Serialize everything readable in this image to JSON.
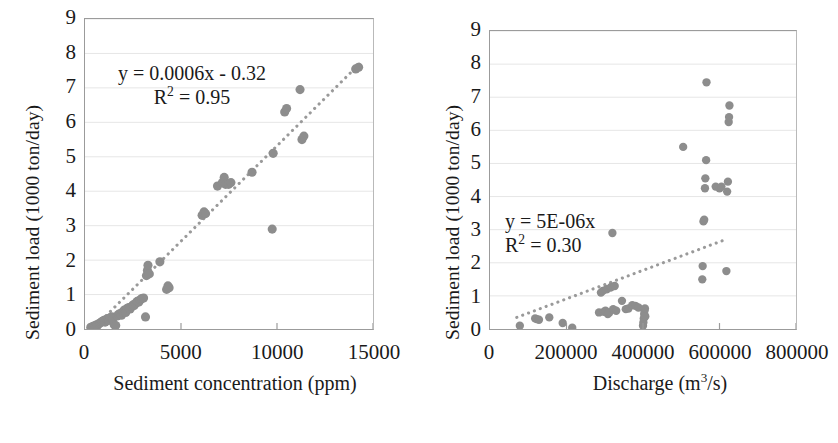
{
  "figure": {
    "marker_color": "#8d8d8d",
    "trendline_color": "#9a9a9a",
    "gridline_color": "#e6e6e6",
    "axis_color": "#9b9b9b",
    "text_color": "#1a1a1a"
  },
  "panels": [
    {
      "id": "left",
      "ytitle": "Sediment load (1000 ton/day)",
      "xtitle_plain": "Sediment concentration (ppm)",
      "equation_line1": "y = 0.0006x - 0.32",
      "equation_line2_prefix": "R",
      "equation_line2_sup": "2",
      "equation_line2_suffix": " = 0.95"
    },
    {
      "id": "right",
      "ytitle": "Sediment load (1000 ton/day)",
      "xtitle_prefix": "Discharge (m",
      "xtitle_sup": "3",
      "xtitle_suffix": "/s)",
      "equation_line1": "y = 5E-06x",
      "equation_line2_prefix": "R",
      "equation_line2_sup": "2",
      "equation_line2_suffix": " = 0.30"
    }
  ],
  "chart_data": [
    {
      "type": "scatter",
      "panel": "left",
      "title": "",
      "xlabel": "Sediment concentration (ppm)",
      "ylabel": "Sediment load (1000 ton/day)",
      "xlim": [
        0,
        15000
      ],
      "ylim": [
        0,
        9
      ],
      "xticks": [
        0,
        5000,
        10000,
        15000
      ],
      "xtick_labels": [
        "0",
        "5000",
        "10000",
        "15000"
      ],
      "yticks": [
        0,
        1,
        2,
        3,
        4,
        5,
        6,
        7,
        8,
        9
      ],
      "ytick_labels": [
        "0",
        "1",
        "2",
        "3",
        "4",
        "5",
        "6",
        "7",
        "8",
        "9"
      ],
      "grid": "horizontal",
      "legend": "none",
      "marker": "circle",
      "marker_color": "#8d8d8d",
      "annotation": {
        "text": "y = 0.0006x - 0.32 ; R² = 0.95",
        "equation": "y = 0.0006x - 0.32",
        "r_squared": 0.95,
        "slope": 0.0006,
        "intercept": -0.32
      },
      "trendline": {
        "style": "dotted",
        "color": "#9a9a9a",
        "x_start": 400,
        "y_start": 0.0,
        "x_end": 14300,
        "y_end": 7.7
      },
      "points": [
        [
          300,
          0.05
        ],
        [
          420,
          0.08
        ],
        [
          520,
          0.1
        ],
        [
          600,
          0.12
        ],
        [
          650,
          0.1
        ],
        [
          720,
          0.15
        ],
        [
          800,
          0.18
        ],
        [
          860,
          0.2
        ],
        [
          900,
          0.22
        ],
        [
          980,
          0.25
        ],
        [
          1050,
          0.2
        ],
        [
          1120,
          0.28
        ],
        [
          1200,
          0.3
        ],
        [
          1250,
          0.25
        ],
        [
          1320,
          0.33
        ],
        [
          1400,
          0.35
        ],
        [
          1450,
          0.3
        ],
        [
          1520,
          0.12
        ],
        [
          1600,
          0.1
        ],
        [
          1680,
          0.38
        ],
        [
          1750,
          0.42
        ],
        [
          1820,
          0.45
        ],
        [
          1900,
          0.4
        ],
        [
          1980,
          0.5
        ],
        [
          2050,
          0.55
        ],
        [
          2120,
          0.48
        ],
        [
          2200,
          0.6
        ],
        [
          2280,
          0.62
        ],
        [
          2350,
          0.58
        ],
        [
          2420,
          0.65
        ],
        [
          2500,
          0.7
        ],
        [
          2560,
          0.68
        ],
        [
          2640,
          0.75
        ],
        [
          2720,
          0.8
        ],
        [
          2800,
          0.78
        ],
        [
          2880,
          0.85
        ],
        [
          2950,
          0.88
        ],
        [
          3050,
          0.9
        ],
        [
          3150,
          0.35
        ],
        [
          3200,
          1.55
        ],
        [
          3250,
          1.7
        ],
        [
          3280,
          1.85
        ],
        [
          3350,
          1.6
        ],
        [
          3900,
          1.95
        ],
        [
          4250,
          1.15
        ],
        [
          4320,
          1.25
        ],
        [
          4380,
          1.2
        ],
        [
          6100,
          3.3
        ],
        [
          6200,
          3.4
        ],
        [
          6280,
          3.35
        ],
        [
          6900,
          4.15
        ],
        [
          7150,
          4.25
        ],
        [
          7250,
          4.4
        ],
        [
          7320,
          4.2
        ],
        [
          7480,
          4.2
        ],
        [
          7600,
          4.25
        ],
        [
          8700,
          4.55
        ],
        [
          9750,
          2.9
        ],
        [
          9800,
          5.1
        ],
        [
          10400,
          6.3
        ],
        [
          10500,
          6.4
        ],
        [
          11200,
          6.95
        ],
        [
          11300,
          5.5
        ],
        [
          11400,
          5.6
        ],
        [
          14100,
          7.55
        ],
        [
          14250,
          7.6
        ]
      ]
    },
    {
      "type": "scatter",
      "panel": "right",
      "title": "",
      "xlabel": "Discharge (m3/s)",
      "ylabel": "Sediment load (1000 ton/day)",
      "xlim": [
        0,
        800000
      ],
      "ylim": [
        0,
        9
      ],
      "xticks": [
        0,
        200000,
        400000,
        600000,
        800000
      ],
      "xtick_labels": [
        "0",
        "200000",
        "400000",
        "600000",
        "800000"
      ],
      "yticks": [
        0,
        1,
        2,
        3,
        4,
        5,
        6,
        7,
        8,
        9
      ],
      "ytick_labels": [
        "0",
        "1",
        "2",
        "3",
        "4",
        "5",
        "6",
        "7",
        "8",
        "9"
      ],
      "grid": "horizontal",
      "legend": "none",
      "marker": "circle",
      "marker_color": "#8d8d8d",
      "annotation": {
        "text": "y = 5E-06x ; R² = 0.30",
        "equation": "y = 5E-06x",
        "r_squared": 0.3,
        "slope": 5e-06,
        "intercept": 0
      },
      "trendline": {
        "style": "dotted",
        "color": "#9a9a9a",
        "x_start": 70000,
        "y_start": 0.35,
        "x_end": 620000,
        "y_end": 2.72
      },
      "points": [
        [
          78000,
          0.1
        ],
        [
          118000,
          0.32
        ],
        [
          122000,
          0.3
        ],
        [
          128000,
          0.28
        ],
        [
          155000,
          0.35
        ],
        [
          190000,
          0.18
        ],
        [
          215000,
          0.04
        ],
        [
          285000,
          0.5
        ],
        [
          290000,
          1.1
        ],
        [
          295000,
          1.15
        ],
        [
          298000,
          0.52
        ],
        [
          302000,
          0.55
        ],
        [
          305000,
          1.2
        ],
        [
          308000,
          0.45
        ],
        [
          312000,
          0.5
        ],
        [
          315000,
          1.25
        ],
        [
          318000,
          1.28
        ],
        [
          320000,
          2.9
        ],
        [
          322000,
          0.6
        ],
        [
          326000,
          1.3
        ],
        [
          330000,
          0.55
        ],
        [
          345000,
          0.85
        ],
        [
          355000,
          0.6
        ],
        [
          362000,
          0.62
        ],
        [
          372000,
          0.72
        ],
        [
          380000,
          0.7
        ],
        [
          388000,
          0.65
        ],
        [
          400000,
          0.1
        ],
        [
          401000,
          0.2
        ],
        [
          402000,
          0.32
        ],
        [
          403000,
          0.45
        ],
        [
          404000,
          0.55
        ],
        [
          405000,
          0.62
        ],
        [
          406000,
          0.38
        ],
        [
          505000,
          5.5
        ],
        [
          555000,
          1.5
        ],
        [
          556000,
          1.9
        ],
        [
          558000,
          3.25
        ],
        [
          560000,
          3.3
        ],
        [
          562000,
          4.25
        ],
        [
          563000,
          4.55
        ],
        [
          565000,
          5.1
        ],
        [
          566000,
          7.45
        ],
        [
          590000,
          4.3
        ],
        [
          600000,
          4.25
        ],
        [
          605000,
          4.3
        ],
        [
          618000,
          1.75
        ],
        [
          620000,
          4.15
        ],
        [
          622000,
          4.45
        ],
        [
          624000,
          6.25
        ],
        [
          625000,
          6.4
        ],
        [
          626000,
          6.75
        ]
      ]
    }
  ]
}
